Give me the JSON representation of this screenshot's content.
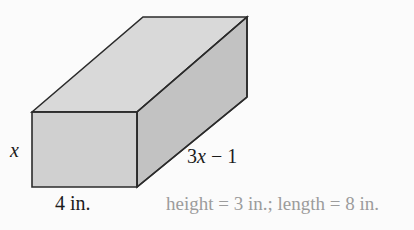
{
  "figure": {
    "name": "rectangular-prism-diagram",
    "type": "3d-rectangular-prism",
    "labels": {
      "height_label": "x",
      "width_label": "4 in.",
      "length_label": "3x − 1"
    },
    "answer": "height = 3 in.; length = 8 in.",
    "colors": {
      "background": "#fbfbfb",
      "front_face": "#d0d0d0",
      "top_face": "#d9d9d9",
      "side_face": "#c2c2c2",
      "edge_stroke": "#2b2b2b",
      "label_text": "#1b1b1b",
      "answer_text": "#9c9c9c"
    },
    "geometry": {
      "front_top_left": [
        32,
        112
      ],
      "front_top_right": [
        137,
        112
      ],
      "front_bottom_right": [
        137,
        187
      ],
      "front_bottom_left": [
        32,
        187
      ],
      "back_top_left": [
        143,
        17
      ],
      "back_top_right": [
        247,
        17
      ],
      "back_bottom_right": [
        247,
        97
      ]
    }
  },
  "solution": {
    "height_value": "3 in.",
    "length_value": "8 in."
  }
}
